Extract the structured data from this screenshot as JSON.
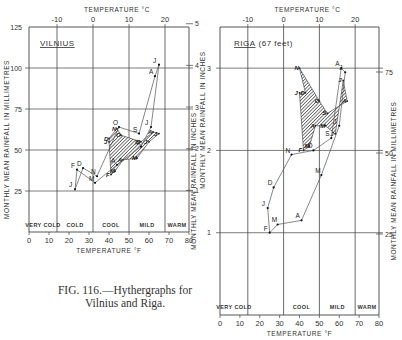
{
  "caption": {
    "line1": "FIG. 116.—Hythergraphs for",
    "line2": "Vilnius and Riga."
  },
  "chart_data": [
    {
      "type": "line",
      "title": "VILNIUS",
      "subtitle": "",
      "xlabel": "TEMPERATURE °F",
      "x2label": "TEMPERATURE °C",
      "ylabel": "MONTHLY MEAN RAINFALL IN MILLIMETRES",
      "y2label": "MONTHLY MEAN RAINFALL IN INCHES",
      "xlim": [
        0,
        80
      ],
      "ylim": [
        0,
        125
      ],
      "x_ticks": [
        0,
        10,
        20,
        30,
        40,
        50,
        60,
        70,
        80
      ],
      "x2_ticks": [
        -10,
        0,
        10,
        20
      ],
      "y_ticks": [
        25,
        50,
        75,
        100,
        125
      ],
      "y2_ticks": [
        1,
        2,
        3,
        4,
        5
      ],
      "zones": [
        "VERY COLD",
        "COLD",
        "COOL",
        "MILD",
        "WARM"
      ],
      "zone_bounds_f": [
        0,
        14,
        32,
        50,
        68,
        80
      ],
      "grid": true,
      "series": [
        {
          "name": "Monthly climate (temperature °F vs rainfall mm)",
          "months": [
            "J",
            "F",
            "M",
            "A",
            "M",
            "J",
            "J",
            "A",
            "S",
            "O",
            "N",
            "D"
          ],
          "x": [
            23,
            24,
            33,
            44,
            56,
            61,
            65,
            63,
            55,
            45,
            34,
            27
          ],
          "y": [
            26,
            38,
            30,
            41,
            52,
            64,
            102,
            95,
            60,
            64,
            34,
            39
          ]
        },
        {
          "name": "Comparison shaded area",
          "months": [
            "J",
            "F",
            "M",
            "A",
            "M",
            "J",
            "J",
            "A",
            "S",
            "O",
            "N",
            "D"
          ],
          "x": [
            40,
            41,
            43,
            47,
            54,
            60,
            65,
            62,
            56,
            46,
            44,
            40
          ],
          "y": [
            55,
            35,
            37,
            44,
            45,
            55,
            60,
            61,
            55,
            59,
            63,
            57
          ]
        }
      ]
    },
    {
      "type": "line",
      "title": "RIGA",
      "subtitle": "(67 feet)",
      "xlabel": "TEMPERATURE °F",
      "x2label": "TEMPERATURE °C",
      "ylabel": "MONTHLY MEAN RAINFALL IN INCHES",
      "y2label": "MONTHLY MEAN RAINFALL IN MILLIMETRES",
      "xlim": [
        0,
        80
      ],
      "ylim": [
        0,
        3.5
      ],
      "x_ticks": [
        0,
        10,
        20,
        30,
        40,
        50,
        60,
        70,
        80
      ],
      "x2_ticks": [
        -10,
        0,
        10,
        20
      ],
      "y_ticks": [
        1,
        2,
        3
      ],
      "y2_ticks": [
        25,
        50,
        75
      ],
      "zones": [
        "VERY COLD",
        "COOL",
        "MILD",
        "WARM"
      ],
      "zone_bounds_f": [
        0,
        14,
        32,
        50,
        68,
        80
      ],
      "grid": true,
      "series": [
        {
          "name": "Monthly climate (temperature °F vs rainfall in)",
          "months": [
            "J",
            "F",
            "M",
            "A",
            "M",
            "J",
            "J",
            "A",
            "S",
            "O",
            "N",
            "D"
          ],
          "x": [
            24,
            25,
            29,
            41,
            51,
            60,
            63,
            61,
            56,
            47,
            36,
            27
          ],
          "y": [
            1.3,
            1.0,
            1.1,
            1.15,
            1.7,
            2.3,
            2.95,
            3.0,
            2.15,
            2.0,
            1.95,
            1.55
          ]
        },
        {
          "name": "Comparison shaded area",
          "months": [
            "J",
            "F",
            "M",
            "A",
            "M",
            "J",
            "J",
            "A",
            "S",
            "O",
            "N",
            "D"
          ],
          "x": [
            40,
            42,
            45,
            48,
            53,
            58,
            62,
            64,
            54,
            50,
            40,
            43
          ],
          "y": [
            2.7,
            2.0,
            2.05,
            2.3,
            2.3,
            2.2,
            2.85,
            2.6,
            2.45,
            2.6,
            3.0,
            2.7
          ]
        }
      ]
    }
  ]
}
